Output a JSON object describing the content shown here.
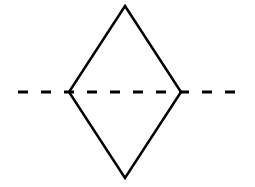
{
  "diagram": {
    "type": "schematic-symbol",
    "symbol_name": "filter",
    "colors": {
      "background": "#ffffff",
      "stroke": "#000000"
    },
    "diamond": {
      "top": [
        125,
        6
      ],
      "right": [
        181,
        92
      ],
      "bottom": [
        125,
        178
      ],
      "left": [
        69,
        92
      ],
      "stroke_width": 2.5
    },
    "dashed_line": {
      "x1": 18,
      "x2": 241,
      "y": 92,
      "dash": 10,
      "gap": 13,
      "stroke_width": 3
    }
  }
}
